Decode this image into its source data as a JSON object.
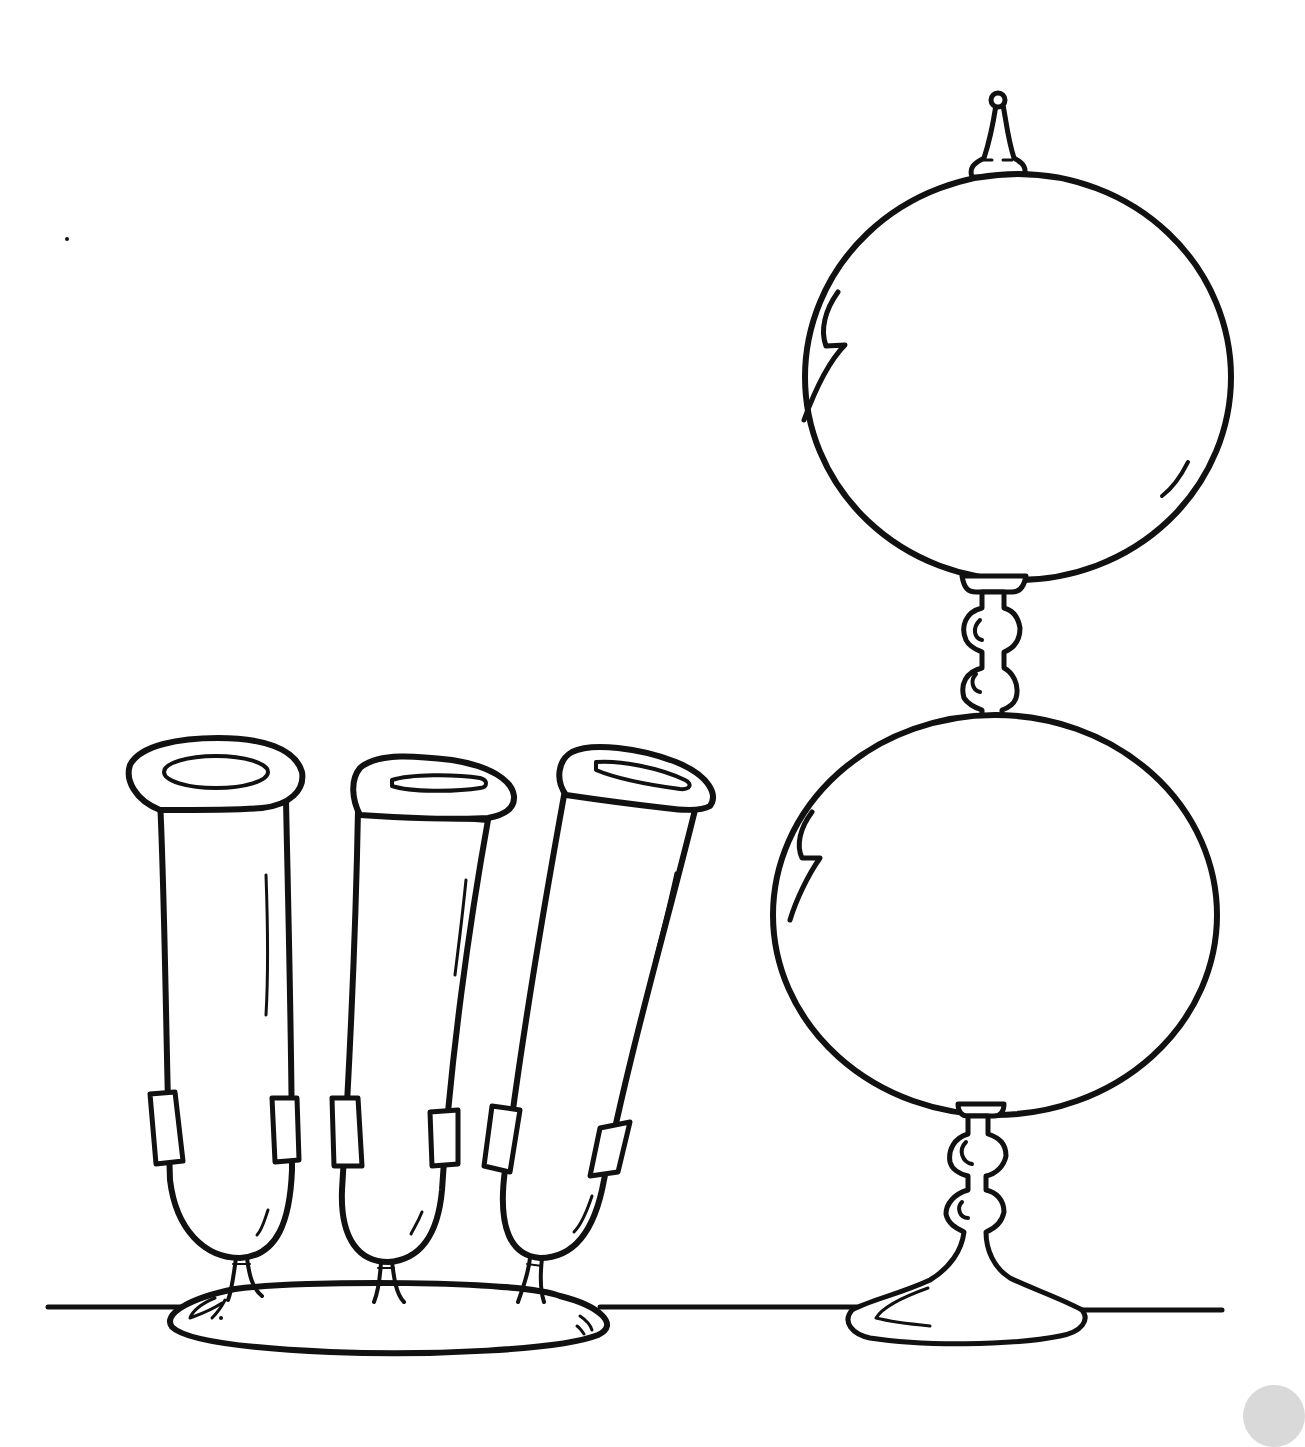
{
  "image": {
    "description": "Black and white line-art coloring page of laboratory glassware",
    "background_color": "#ffffff",
    "ink_color": "#111111"
  },
  "objects": [
    {
      "name": "test-tube-rack",
      "description": "Three test tubes held upright with clips on an oval base",
      "tube_count": 3
    },
    {
      "name": "double-sphere-glass",
      "description": "Two stacked glass spheres joined by a beaded stem, topped with a finial, on a flared foot"
    }
  ],
  "table_line": {
    "y": 1307
  },
  "corner_mark_color": "#d9d9d9"
}
